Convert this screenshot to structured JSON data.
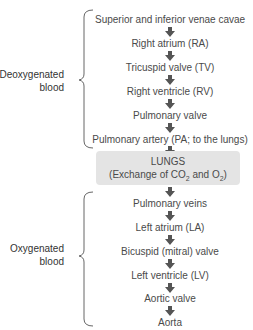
{
  "diagram": {
    "deoxygenated_group": {
      "label_line1": "Deoxygenated",
      "label_line2": "blood",
      "steps": [
        "Superior and inferior venae cavae",
        "Right atrium (RA)",
        "Tricuspid valve (TV)",
        "Right ventricle (RV)",
        "Pulmonary valve",
        "Pulmonary artery (PA; to the lungs)"
      ]
    },
    "lungs": {
      "line1": "LUNGS",
      "line2_prefix": "(Exchange of CO",
      "sub1": "2",
      "line2_mid": " and O",
      "sub2": "2",
      "line2_suffix": ")"
    },
    "oxygenated_group": {
      "label_line1": "Oxygenated",
      "label_line2": "blood",
      "steps": [
        "Pulmonary veins",
        "Left atrium (LA)",
        "Bicuspid (mitral) valve",
        "Left ventricle (LV)",
        "Aortic valve",
        "Aorta"
      ]
    },
    "colors": {
      "text": "#4a4a4a",
      "arrow": "#555555",
      "lungs_box": "#e4e4e4",
      "brace": "#666666"
    }
  }
}
